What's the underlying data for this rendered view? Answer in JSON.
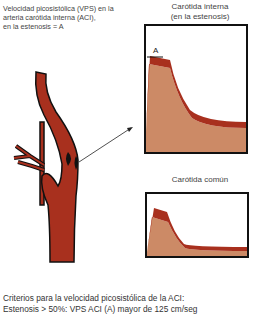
{
  "caption_top": {
    "line1": "Velocidad picosistólica (VPS) en la",
    "line2": "arteria carótida interna (ACI),",
    "line3": "en la estenosis = A"
  },
  "panels": [
    {
      "title_line1": "Carótida interna",
      "title_line2": "(en la estenosis)",
      "peak_label": "A"
    },
    {
      "title_line1": "Carótida común"
    }
  ],
  "footer": {
    "line1": "Criterios para la velocidad picosistólica de la ACI:",
    "line2": "Estenosis > 50%: VPS ACI (A) mayor de 125 cm/seg"
  },
  "colors": {
    "artery": "#a8301e",
    "waveform_envelope": "#a8301e",
    "waveform_fill": "#cc8a66",
    "frame": "#111111"
  }
}
